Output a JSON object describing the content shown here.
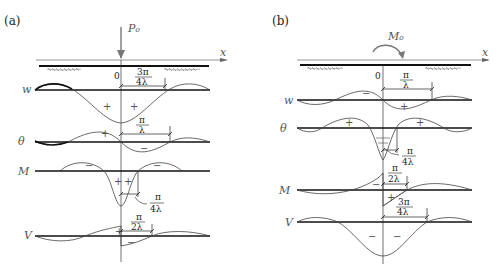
{
  "figure": {
    "panels": [
      {
        "id": "a",
        "label": "(a)",
        "load": "P₀",
        "load_type": "concentrated force",
        "axis_label": "x",
        "origin_label": "0",
        "diagrams": [
          {
            "name": "w",
            "label": "w",
            "signs": [
              "+",
              "+"
            ],
            "dimension": {
              "num": "3π",
              "den": "4λ"
            }
          },
          {
            "name": "theta",
            "label": "θ",
            "signs": [
              "+",
              "−"
            ],
            "dimension": {
              "num": "π",
              "den": "λ"
            }
          },
          {
            "name": "M",
            "label": "M",
            "signs": [
              "−",
              "+",
              "+",
              "−"
            ],
            "dimension": {
              "num": "π",
              "den": "4λ"
            }
          },
          {
            "name": "V",
            "label": "V",
            "signs": [
              "+",
              "−"
            ],
            "dimension": {
              "num": "π",
              "den": "2λ"
            }
          }
        ]
      },
      {
        "id": "b",
        "label": "(b)",
        "load": "M₀",
        "load_type": "concentrated moment",
        "axis_label": "x",
        "origin_label": "0",
        "diagrams": [
          {
            "name": "w",
            "label": "w",
            "signs": [
              "−",
              "+"
            ],
            "dimension": {
              "num": "π",
              "den": "λ"
            }
          },
          {
            "name": "theta",
            "label": "θ",
            "signs": [
              "+",
              "+"
            ],
            "dimension": {
              "num": "π",
              "den": "4λ"
            }
          },
          {
            "name": "M",
            "label": "M",
            "signs": [
              "−",
              "+"
            ],
            "dimension": {
              "num": "π",
              "den": "2λ"
            }
          },
          {
            "name": "V",
            "label": "V",
            "signs": [
              "−",
              "−"
            ],
            "dimension": {
              "num": "3π",
              "den": "4λ"
            }
          }
        ]
      }
    ]
  }
}
